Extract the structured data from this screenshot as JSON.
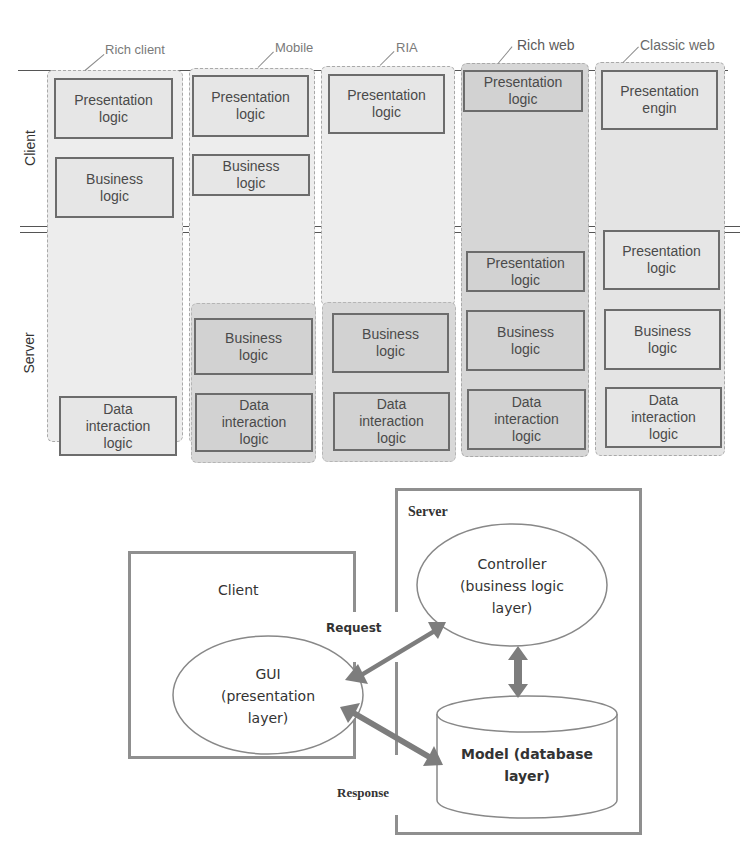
{
  "top_diagram": {
    "row_labels": {
      "client": "Client",
      "server": "Server"
    },
    "columns": [
      {
        "title": "Rich client",
        "client_boxes": [
          "Presentation\nlogic",
          "Business\nlogic"
        ],
        "server_boxes": [
          "Data\ninteraction\nlogic"
        ]
      },
      {
        "title": "Mobile",
        "client_boxes": [
          "Presentation\nlogic",
          "Business\nlogic"
        ],
        "server_boxes": [
          "Business\nlogic",
          "Data\ninteraction\nlogic"
        ]
      },
      {
        "title": "RIA",
        "client_boxes": [
          "Presentation\nlogic"
        ],
        "server_boxes": [
          "Business\nlogic",
          "Data\ninteraction\nlogic"
        ]
      },
      {
        "title": "Rich web",
        "client_boxes": [
          "Presentation\nlogic"
        ],
        "server_boxes": [
          "Presentation\nlogic",
          "Business\nlogic",
          "Data\ninteraction\nlogic"
        ]
      },
      {
        "title": "Classic web",
        "client_boxes": [
          "Presentation\nengin"
        ],
        "server_boxes": [
          "Presentation\nlogic",
          "Business\nlogic",
          "Data\ninteraction\nlogic"
        ]
      }
    ]
  },
  "bottom_diagram": {
    "client_title": "Client",
    "server_title": "Server",
    "gui": "GUI\n(presentation\nlayer)",
    "controller": "Controller\n(business logic\nlayer)",
    "model": "Model (database\nlayer)",
    "request_label": "Request",
    "response_label": "Response",
    "colors": {
      "frame": "#8f8f8f",
      "arrow": "#7d7d7d"
    }
  }
}
